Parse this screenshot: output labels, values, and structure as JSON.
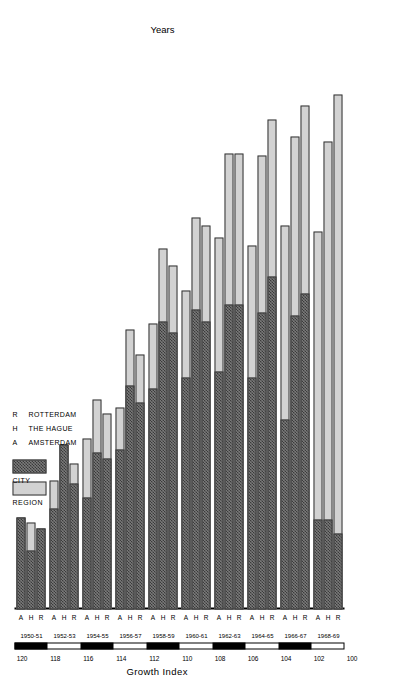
{
  "chart_data": {
    "type": "bar",
    "orientation": "horizontal",
    "title": "",
    "xlabel": "Years",
    "ylabel": "Growth Index",
    "ylim": [
      100,
      120
    ],
    "yticks": [
      100,
      102,
      104,
      106,
      108,
      110,
      112,
      114,
      116,
      118,
      120
    ],
    "ytick_labels": [
      "100",
      "102",
      "104",
      "106",
      "108",
      "110",
      "112",
      "114",
      "116",
      "118",
      "120"
    ],
    "grid": false,
    "legend_position": "upper-left-inset",
    "legend": [
      {
        "key": "REGION",
        "label": "REGION",
        "fill": "light-gray",
        "color": "#d2d2d2"
      },
      {
        "key": "CITY",
        "label": "CITY",
        "fill": "dark-checkered",
        "color": "#4a4a4a"
      }
    ],
    "key": [
      {
        "letter": "A",
        "name": "AMSTERDAM"
      },
      {
        "letter": "H",
        "name": "THE HAGUE"
      },
      {
        "letter": "R",
        "name": "ROTTERDAM"
      }
    ],
    "categories": [
      "1950-51",
      "1952-53",
      "1954-55",
      "1956-57",
      "1958-59",
      "1960-61",
      "1962-63",
      "1964-65",
      "1966-67",
      "1968-69"
    ],
    "subcategories": [
      "A",
      "H",
      "R"
    ],
    "series": [
      {
        "name": "CITY",
        "values": [
          [
            103.3,
            102.1,
            102.9
          ],
          [
            103.6,
            105.9,
            104.5
          ],
          [
            104.0,
            105.6,
            105.4
          ],
          [
            105.7,
            108.0,
            107.4
          ],
          [
            107.9,
            110.3,
            109.9
          ],
          [
            108.3,
            110.7,
            110.3
          ],
          [
            108.5,
            110.9,
            110.9
          ],
          [
            108.3,
            110.6,
            111.9
          ],
          [
            106.8,
            110.5,
            111.3
          ],
          [
            103.2,
            103.2,
            102.7
          ]
        ]
      },
      {
        "name": "REGION",
        "values": [
          [
            103.3,
            103.1,
            102.9
          ],
          [
            104.6,
            105.9,
            105.2
          ],
          [
            106.1,
            107.5,
            107.0
          ],
          [
            107.2,
            110.0,
            109.1
          ],
          [
            110.2,
            112.9,
            112.3
          ],
          [
            111.4,
            114.0,
            113.7
          ],
          [
            113.3,
            116.3,
            116.3
          ],
          [
            113.0,
            116.2,
            117.5
          ],
          [
            113.7,
            116.9,
            118.0
          ],
          [
            113.5,
            116.7,
            118.4
          ]
        ]
      }
    ]
  },
  "axes": {
    "value_axis_title": "Growth Index",
    "category_axis_title": "Years"
  }
}
